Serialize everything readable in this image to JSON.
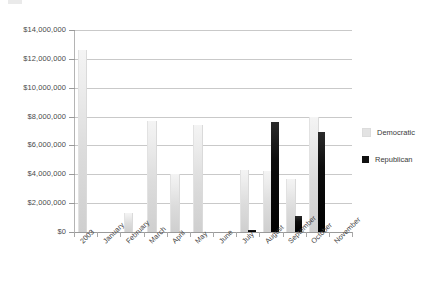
{
  "chart_data": {
    "type": "bar",
    "title": "",
    "xlabel": "",
    "ylabel": "",
    "ylim": [
      0,
      14000000
    ],
    "grid": true,
    "legend_position": "right",
    "categories": [
      "2003",
      "January",
      "February",
      "March",
      "April",
      "May",
      "June",
      "July",
      "August",
      "September",
      "October",
      "November"
    ],
    "ytick_labels": [
      "$14,000,000",
      "$12,000,000",
      "$10,000,000",
      "$8,000,000",
      "$6,000,000",
      "$4,000,000",
      "$2,000,000",
      "$0"
    ],
    "ytick_values": [
      14000000,
      12000000,
      10000000,
      8000000,
      6000000,
      4000000,
      2000000,
      0
    ],
    "series": [
      {
        "name": "Democratic",
        "color": "#e3e3e3",
        "values": [
          12600000,
          0,
          1300000,
          7700000,
          4000000,
          7400000,
          0,
          4300000,
          4200000,
          3700000,
          8000000,
          0
        ]
      },
      {
        "name": "Republican",
        "color": "#111111",
        "values": [
          0,
          0,
          0,
          0,
          0,
          0,
          0,
          150000,
          7650000,
          1100000,
          6900000,
          0
        ]
      }
    ]
  },
  "legend": {
    "items": [
      {
        "label": "Democratic",
        "swatch": "democratic-swatch"
      },
      {
        "label": "Republican",
        "swatch": "republican-swatch"
      }
    ]
  }
}
